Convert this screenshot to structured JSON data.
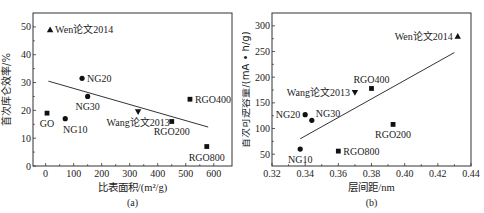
{
  "chart_data": [
    {
      "type": "scatter",
      "panel": "(a)",
      "xlabel": "比表面积/(m²/g)",
      "ylabel": "首次库仑效率/%",
      "xlim": [
        -45,
        665
      ],
      "ylim": [
        0,
        55
      ],
      "xticks": [
        0,
        100,
        200,
        300,
        400,
        500,
        600
      ],
      "yticks": [
        0,
        10,
        20,
        30,
        40,
        50
      ],
      "grid": false,
      "points": [
        {
          "label": "Wen论文2014",
          "x": 16,
          "y": 49,
          "marker": "triangle-up",
          "label_pos": "right"
        },
        {
          "label": "GO",
          "x": 5,
          "y": 19,
          "marker": "square",
          "label_pos": "below"
        },
        {
          "label": "NG10",
          "x": 70,
          "y": 17,
          "marker": "circle",
          "label_pos": "below-right"
        },
        {
          "label": "NG20",
          "x": 130,
          "y": 31.5,
          "marker": "circle",
          "label_pos": "right"
        },
        {
          "label": "NG30",
          "x": 150,
          "y": 25,
          "marker": "circle",
          "label_pos": "below"
        },
        {
          "label": "Wang论文2013",
          "x": 330,
          "y": 19.5,
          "marker": "triangle-down",
          "label_pos": "below"
        },
        {
          "label": "RGO200",
          "x": 450,
          "y": 16,
          "marker": "square",
          "label_pos": "below"
        },
        {
          "label": "RGO400",
          "x": 515,
          "y": 24,
          "marker": "square",
          "label_pos": "right"
        },
        {
          "label": "RGO800",
          "x": 575,
          "y": 7,
          "marker": "square",
          "label_pos": "below"
        }
      ],
      "fit_line": {
        "x": [
          10,
          580
        ],
        "y": [
          30.5,
          14
        ]
      }
    },
    {
      "type": "scatter",
      "panel": "(b)",
      "xlabel": "层间距/nm",
      "ylabel": "首次可逆容量/(mA • h/g)",
      "xlim": [
        0.32,
        0.44
      ],
      "ylim": [
        27,
        325
      ],
      "xticks": [
        0.32,
        0.34,
        0.36,
        0.38,
        0.4,
        0.42,
        0.44
      ],
      "yticks": [
        50,
        100,
        150,
        200,
        250,
        300
      ],
      "grid": false,
      "points": [
        {
          "label": "NG10",
          "x": 0.337,
          "y": 60,
          "marker": "circle",
          "label_pos": "below"
        },
        {
          "label": "NG20",
          "x": 0.34,
          "y": 127,
          "marker": "circle",
          "label_pos": "left"
        },
        {
          "label": "NG30",
          "x": 0.344,
          "y": 116,
          "marker": "circle",
          "label_pos": "above-right"
        },
        {
          "label": "RGO800",
          "x": 0.36,
          "y": 56,
          "marker": "square",
          "label_pos": "right"
        },
        {
          "label": "Wang论文2013",
          "x": 0.37,
          "y": 170,
          "marker": "triangle-down",
          "label_pos": "left"
        },
        {
          "label": "RGO400",
          "x": 0.38,
          "y": 178,
          "marker": "square",
          "label_pos": "above"
        },
        {
          "label": "RGO200",
          "x": 0.393,
          "y": 108,
          "marker": "square",
          "label_pos": "below"
        },
        {
          "label": "Wen论文2014",
          "x": 0.432,
          "y": 280,
          "marker": "triangle-up",
          "label_pos": "left"
        }
      ],
      "fit_line": {
        "x": [
          0.337,
          0.43
        ],
        "y": [
          80,
          248
        ]
      }
    }
  ]
}
